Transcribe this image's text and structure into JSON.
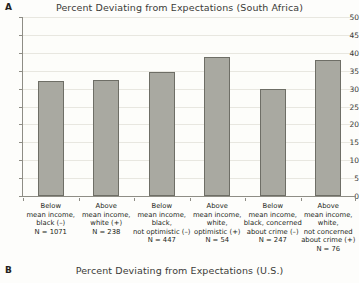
{
  "panels": [
    {
      "letter": "A",
      "title": "Percent Deviating from Expectations (South Africa)"
    },
    {
      "letter": "B",
      "title": "Percent Deviating from Expectations (U.S.)"
    }
  ],
  "chart_data": {
    "type": "bar",
    "title": "Percent Deviating from Expectations (South Africa)",
    "xlabel": "",
    "ylabel": "",
    "ylim": [
      0,
      50
    ],
    "yticks": [
      0,
      5,
      10,
      15,
      20,
      25,
      30,
      35,
      40,
      45,
      50
    ],
    "ytick_labels": [
      "0",
      "5",
      "10",
      "15",
      "20",
      "25",
      "30",
      "35",
      "40",
      "45",
      "50"
    ],
    "grid": true,
    "legend": "none",
    "bar_color": "#a9a9a1",
    "bar_edge_color": "#6e6e66",
    "categories": [
      "Below mean income, black (–)\nN = 1071",
      "Above mean income, white (+)\nN = 238",
      "Below mean income, black, not optimistic (–)\nN = 447",
      "Above mean income, white, optimistic (+)\nN = 54",
      "Below mean income, black, concerned about crime (–)\nN = 247",
      "Above mean income, white, not concerned about crime (+)\nN = 76"
    ],
    "category_lines": [
      [
        "Below",
        "mean income,",
        "black (–)",
        "N = 1071"
      ],
      [
        "Above",
        "mean income,",
        "white (+)",
        "N = 238"
      ],
      [
        "Below",
        "mean income,",
        "black,",
        "not optimistic (–)",
        "N = 447"
      ],
      [
        "Above",
        "mean income,",
        "white,",
        "optimistic (+)",
        "N = 54"
      ],
      [
        "Below",
        "mean income,",
        "black, concerned",
        "about crime (–)",
        "N = 247"
      ],
      [
        "Above",
        "mean income,",
        "white,",
        "not concerned",
        "about crime (+)",
        "N = 76"
      ]
    ],
    "sample_sizes": [
      1071,
      238,
      447,
      54,
      247,
      76
    ],
    "values": [
      32.2,
      32.3,
      34.7,
      38.9,
      29.9,
      38.1
    ]
  }
}
